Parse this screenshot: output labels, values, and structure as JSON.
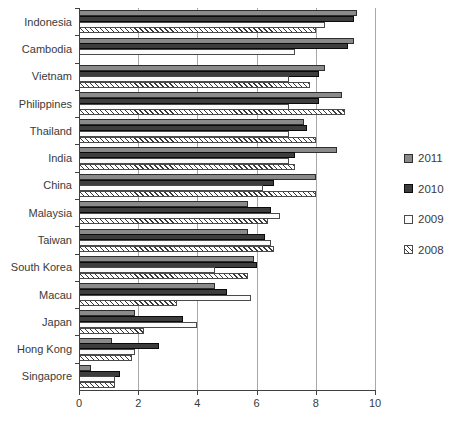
{
  "chart_data": {
    "type": "bar",
    "orientation": "horizontal",
    "title": "",
    "xlabel": "",
    "ylabel": "",
    "xlim": [
      0,
      10
    ],
    "xticks": [
      0,
      2,
      4,
      6,
      8,
      10
    ],
    "grid": "vertical",
    "legend_position": "right",
    "categories": [
      "Indonesia",
      "Cambodia",
      "Vietnam",
      "Philippines",
      "Thailand",
      "India",
      "China",
      "Malaysia",
      "Taiwan",
      "South Korea",
      "Macau",
      "Japan",
      "Hong Kong",
      "Singapore"
    ],
    "series": [
      {
        "name": "2011",
        "values": [
          9.4,
          9.3,
          8.3,
          8.9,
          7.6,
          8.7,
          8.0,
          5.7,
          5.7,
          5.9,
          4.6,
          1.9,
          1.1,
          0.4
        ]
      },
      {
        "name": "2010",
        "values": [
          9.3,
          9.1,
          8.1,
          8.1,
          7.7,
          7.3,
          6.6,
          6.5,
          6.3,
          6.0,
          5.0,
          3.5,
          2.7,
          1.4
        ]
      },
      {
        "name": "2009",
        "values": [
          8.3,
          7.3,
          7.1,
          7.1,
          7.1,
          7.1,
          6.2,
          6.8,
          6.5,
          4.6,
          5.8,
          4.0,
          1.9,
          1.2
        ]
      },
      {
        "name": "2008",
        "values": [
          8.0,
          null,
          7.8,
          9.0,
          8.0,
          7.3,
          8.0,
          6.4,
          6.6,
          5.7,
          3.3,
          2.2,
          1.8,
          1.2
        ]
      }
    ],
    "series_styles": {
      "2011": {
        "fill": "#8a8a8a",
        "border": "#2e2e2e",
        "pattern": "solid"
      },
      "2010": {
        "fill": "#3d3d3d",
        "border": "#0a0a0a",
        "pattern": "solid"
      },
      "2009": {
        "fill": "#fbfbfb",
        "border": "#4a4a4a",
        "pattern": "solid"
      },
      "2008": {
        "fill": "#ffffff",
        "border": "#4a4a4a",
        "pattern": "diagonal-hatch",
        "hatch_color": "#3a3a3a"
      }
    },
    "gridline_color": "#a8a8a8",
    "axis_color": "#404040",
    "x_tick_labels": [
      "0",
      "2",
      "4",
      "6",
      "8",
      "10"
    ]
  },
  "legend": {
    "items": [
      {
        "label": "2011"
      },
      {
        "label": "2010"
      },
      {
        "label": "2009"
      },
      {
        "label": "2008"
      }
    ]
  }
}
